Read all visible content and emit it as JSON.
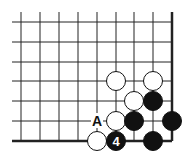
{
  "diagram": {
    "type": "go-board-corner",
    "board_edges": [
      "right",
      "bottom"
    ],
    "grid": {
      "columns_x": [
        21,
        40,
        59,
        78,
        97,
        116,
        134,
        153,
        172
      ],
      "rows_y": [
        22,
        42,
        62,
        81,
        101,
        121,
        141
      ],
      "left_extent": 12,
      "top_extent": 12
    },
    "stones": [
      {
        "color": "white",
        "col": 5,
        "row": 3
      },
      {
        "color": "white",
        "col": 7,
        "row": 3
      },
      {
        "color": "white",
        "col": 6,
        "row": 4
      },
      {
        "color": "black",
        "col": 7,
        "row": 4
      },
      {
        "color": "white",
        "col": 5,
        "row": 5
      },
      {
        "color": "black",
        "col": 6,
        "row": 5
      },
      {
        "color": "black",
        "col": 8,
        "row": 5
      },
      {
        "color": "white",
        "col": 4,
        "row": 6
      },
      {
        "color": "black",
        "col": 5,
        "row": 6,
        "label": "4"
      },
      {
        "color": "black",
        "col": 7,
        "row": 6
      }
    ],
    "markers": [
      {
        "text": "A",
        "col": 4,
        "row": 5
      }
    ]
  }
}
